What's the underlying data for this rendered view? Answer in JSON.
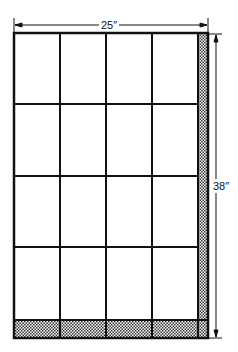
{
  "diagram": {
    "width_label": "25″",
    "height_label": "38″",
    "grid": {
      "columns": 4,
      "rows": 4
    },
    "shaded_strips": [
      "right",
      "bottom"
    ],
    "colors": {
      "line": "#111111",
      "background": "#ffffff",
      "shade": "#555555"
    }
  }
}
